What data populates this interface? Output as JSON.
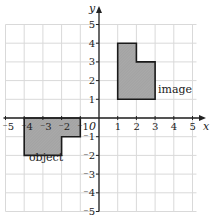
{
  "diagram": {
    "type": "coordinate-grid-transformation",
    "axes": {
      "x_label": "x",
      "y_label": "y",
      "origin_label": "0",
      "x_range": [
        -5,
        5
      ],
      "y_range": [
        -5,
        5
      ],
      "x_ticks": [
        "-5",
        "-4",
        "-3",
        "-2",
        "-1",
        "1",
        "2",
        "3",
        "4",
        "5"
      ],
      "y_ticks": [
        "5",
        "4",
        "3",
        "2",
        "1",
        "-1",
        "-2",
        "-3",
        "-4",
        "-5"
      ]
    },
    "shapes": [
      {
        "name": "object",
        "label": "object",
        "vertices": [
          [
            -4,
            0
          ],
          [
            -1,
            0
          ],
          [
            -1,
            -1
          ],
          [
            -2,
            -1
          ],
          [
            -2,
            -2
          ],
          [
            -4,
            -2
          ]
        ]
      },
      {
        "name": "image",
        "label": "image",
        "vertices": [
          [
            1,
            1
          ],
          [
            3,
            1
          ],
          [
            3,
            3
          ],
          [
            2,
            3
          ],
          [
            2,
            4
          ],
          [
            1,
            4
          ]
        ]
      }
    ],
    "colors": {
      "grid": "#d9d9d9",
      "axis": "#222222",
      "shape_fill": "#a9a9a9",
      "shape_stroke": "#1a1a1a"
    }
  }
}
